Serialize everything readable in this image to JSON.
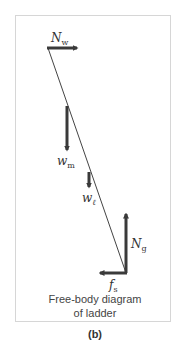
{
  "figure": {
    "panel_label": "(b)",
    "caption_line1": "Free-body diagram",
    "caption_line2": "of ladder"
  },
  "forces": [
    {
      "id": "N_w",
      "symbol": "N",
      "subscript": "w",
      "direction": "right"
    },
    {
      "id": "w_m",
      "symbol": "w",
      "subscript": "m",
      "direction": "down"
    },
    {
      "id": "w_l",
      "symbol": "w",
      "subscript": "ℓ",
      "direction": "down"
    },
    {
      "id": "N_g",
      "symbol": "N",
      "subscript": "g",
      "direction": "up"
    },
    {
      "id": "f_s",
      "symbol": "f",
      "subscript": "s",
      "direction": "left"
    }
  ],
  "colors": {
    "arrow": "#3a3a3a",
    "ladder_line": "#444444",
    "frame": "#d6d6d6",
    "text": "#333333"
  }
}
